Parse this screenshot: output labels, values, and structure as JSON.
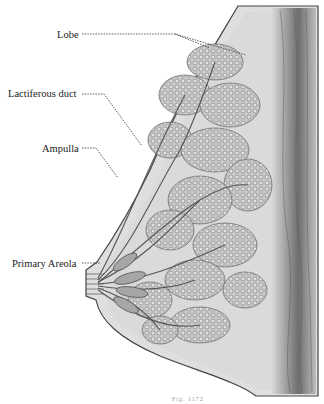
{
  "figure": {
    "type": "anatomical illustration",
    "caption_partial": "Fig. 1172"
  },
  "labels": [
    {
      "id": "lobe",
      "text": "Lobe"
    },
    {
      "id": "lactiferous-duct",
      "text": "Lactiferous duct"
    },
    {
      "id": "ampulla",
      "text": "Ampulla"
    },
    {
      "id": "primary-areola",
      "text": "Primary Areola"
    }
  ],
  "colors": {
    "background": "#ffffff",
    "tissue_fill": "#d9d9d9",
    "lobule_fill": "#bdbdbd",
    "muscle_fill": "#8a8a8a",
    "outline": "#444444",
    "leader_line": "#333333"
  }
}
